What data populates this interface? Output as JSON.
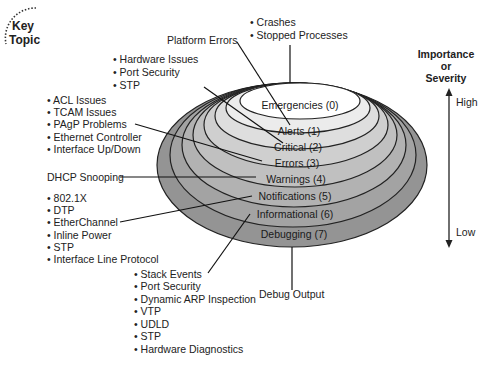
{
  "key_topic": {
    "line1": "Key",
    "line2": "Topic"
  },
  "levels": [
    {
      "label": "Emergencies (0)",
      "fill": "#ffffff"
    },
    {
      "label": "Alerts (1)",
      "fill": "#ececec"
    },
    {
      "label": "Critical (2)",
      "fill": "#dedede"
    },
    {
      "label": "Errors (3)",
      "fill": "#cfcfcf"
    },
    {
      "label": "Warnings (4)",
      "fill": "#c0c0c0"
    },
    {
      "label": "Notifications (5)",
      "fill": "#b2b2b2"
    },
    {
      "label": "Informational (6)",
      "fill": "#a3a3a3"
    },
    {
      "label": "Debugging (7)",
      "fill": "#949494"
    }
  ],
  "callouts": {
    "emergencies": [
      "Crashes",
      "Stopped Processes"
    ],
    "alerts": "Platform Errors",
    "critical": [
      "Hardware Issues",
      "Port Security",
      "STP"
    ],
    "errors": [
      "ACL Issues",
      "TCAM Issues",
      "PAgP Problems",
      "Ethernet Controller",
      "Interface Up/Down"
    ],
    "warnings": "DHCP Snooping",
    "notifications": [
      "802.1X",
      "DTP",
      "EtherChannel",
      "Inline Power",
      "STP",
      "Interface Line Protocol"
    ],
    "informational": [
      "Stack Events",
      "Port Security",
      "Dynamic ARP Inspection",
      "VTP",
      "UDLD",
      "STP",
      "Hardware Diagnostics"
    ],
    "debugging": "Debug Output"
  },
  "axis": {
    "title_line1": "Importance",
    "title_line2": "or",
    "title_line3": "Severity",
    "high": "High",
    "low": "Low"
  }
}
